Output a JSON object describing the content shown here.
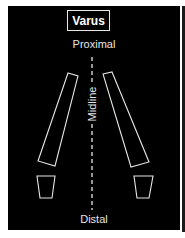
{
  "diagram": {
    "title": "Varus",
    "labels": {
      "top": "Proximal",
      "bottom": "Distal",
      "center_axis": "Midline"
    },
    "colors": {
      "background": "#000000",
      "stroke": "#e6e6e6",
      "page": "#ffffff"
    },
    "shapes": {
      "left_long_segment": "68,73 78,76 55,166 38,161",
      "right_long_segment": "103,74 112,72 149,162 131,167",
      "left_foot_block": "37,176 55,176 52,198 40,198",
      "right_foot_block": "134,176 153,176 149,198 137,198"
    }
  }
}
